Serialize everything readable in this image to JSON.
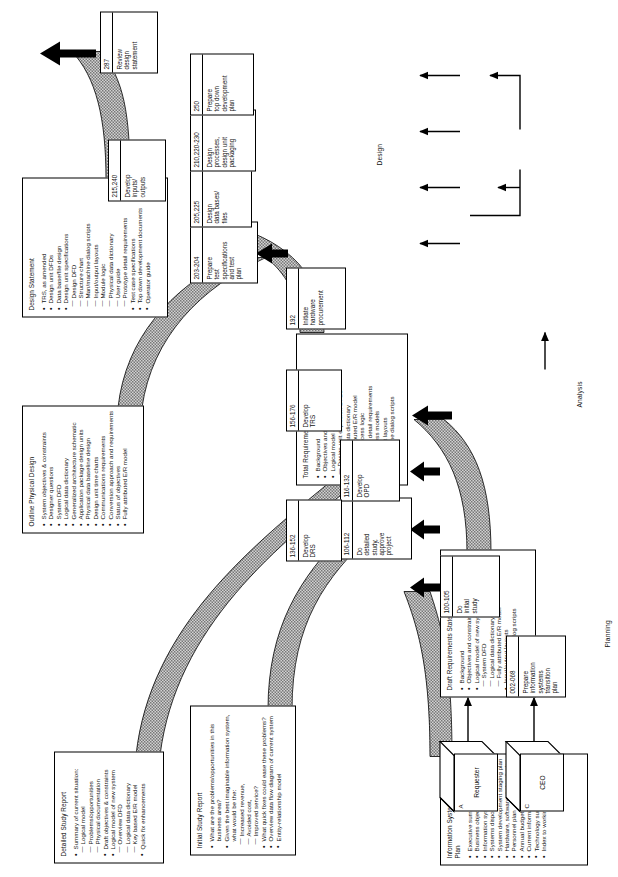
{
  "diagram": {
    "phases": [
      {
        "id": "planning",
        "label": "Planning"
      },
      {
        "id": "analysis",
        "label": "Analysis"
      },
      {
        "id": "design",
        "label": "Design"
      }
    ],
    "external_entities": [
      {
        "tag": "C",
        "label": "CEO"
      },
      {
        "tag": "A",
        "label": "Requester"
      }
    ],
    "processes": [
      {
        "id": "002-068",
        "label": "Prepare\ninformation\nsystems\ntransition\nplan"
      },
      {
        "id": "100-105",
        "label": "Do\ninitial\nstudy"
      },
      {
        "id": "106-112",
        "label": "Do\ndetailed\nstudy,\napprove\nproject"
      },
      {
        "id": "116-132",
        "label": "Develop\nOPD"
      },
      {
        "id": "136-152",
        "label": "Develop\nDRS"
      },
      {
        "id": "156-176",
        "label": "Develop\nTRS"
      },
      {
        "id": "192",
        "label": "Initiate\nhardware\nprocurement"
      },
      {
        "id": "203-204",
        "label": "Prepare\ntest\nspecifications\nand test\nplan"
      },
      {
        "id": "205,225",
        "label": "Design\ndata bases/\nfiles"
      },
      {
        "id": "210,220-230",
        "label": "Design\nprocesses,\ndesign unit\npackaging"
      },
      {
        "id": "215,240",
        "label": "Develop\ninputs/\noutputs"
      },
      {
        "id": "250",
        "label": "Prepare\ntop down\ndevelopment\nplan"
      },
      {
        "id": "287",
        "label": "Review\ndesign\nstatement"
      }
    ],
    "documents": [
      {
        "id": "transition-plan",
        "title": "Information Systems Transition Plan",
        "items": [
          {
            "type": "bullet",
            "text": "Executive summary"
          },
          {
            "type": "bullet",
            "text": "Business objectives and constraints"
          },
          {
            "type": "bullet",
            "text": "Information systems model"
          },
          {
            "type": "bullet",
            "text": "Systems disposition lists summary"
          },
          {
            "type": "bullet",
            "text": "System development staging plan"
          },
          {
            "type": "bullet",
            "text": "Hardware, software, network plan"
          },
          {
            "type": "bullet",
            "text": "Personnel plan"
          },
          {
            "type": "bullet",
            "text": "Annual budgets"
          },
          {
            "type": "bullet",
            "text": "Current information systems evaluation"
          },
          {
            "type": "bullet",
            "text": "Technology summary"
          },
          {
            "type": "bullet",
            "text": "Index to working papers"
          }
        ]
      },
      {
        "id": "initial-study-report",
        "title": "Initial Study Report",
        "items": [
          {
            "type": "bullet",
            "text": "What are the problems/opportunities in this"
          },
          {
            "type": "cont",
            "text": "business area?"
          },
          {
            "type": "bullet",
            "text": "Given the best imaginable information system,"
          },
          {
            "type": "cont",
            "text": "what would be the:"
          },
          {
            "type": "dash",
            "text": "Increased revenue,"
          },
          {
            "type": "dash",
            "text": "Avoided cost,"
          },
          {
            "type": "dash",
            "text": "Improved service?"
          },
          {
            "type": "bullet",
            "text": "What quick fixes could ease these problems?"
          },
          {
            "type": "bullet",
            "text": "Overview data flow diagram of current system"
          },
          {
            "type": "bullet",
            "text": "Entity-relationship model"
          }
        ]
      },
      {
        "id": "detailed-study-report",
        "title": "Detailed Study Report",
        "items": [
          {
            "type": "bullet",
            "text": "Summary of current situation:"
          },
          {
            "type": "dash",
            "text": "Logical model"
          },
          {
            "type": "dash",
            "text": "Problems/opportunities"
          },
          {
            "type": "dash",
            "text": "Physical documentation"
          },
          {
            "type": "bullet",
            "text": "Draft objectives & constraints"
          },
          {
            "type": "bullet",
            "text": "Logical model of new system"
          },
          {
            "type": "dash",
            "text": "Overview DFD"
          },
          {
            "type": "dash",
            "text": "Logical data dictionary"
          },
          {
            "type": "dash",
            "text": "Key based E/R model"
          },
          {
            "type": "bullet",
            "text": "Quick fix enhancements"
          }
        ]
      },
      {
        "id": "draft-requirements-statement",
        "title": "Draft Requirements Statement",
        "items": [
          {
            "type": "bullet",
            "text": "Background"
          },
          {
            "type": "bullet",
            "text": "Objectives and constraints"
          },
          {
            "type": "bullet",
            "text": "Logical model of new system"
          },
          {
            "type": "dash",
            "text": "System DFD"
          },
          {
            "type": "dash",
            "text": "Logical data dictionary"
          },
          {
            "type": "dash",
            "text": "Fully attributed E/R model"
          },
          {
            "type": "bullet",
            "text": "Input/output layouts"
          },
          {
            "type": "bullet",
            "text": "Man/machine dialog scripts"
          }
        ]
      },
      {
        "id": "total-requirement-statement",
        "title": "Total Requirement Statement",
        "items": [
          {
            "type": "bullet",
            "text": "Background"
          },
          {
            "type": "bullet",
            "text": "Objectives and constraints"
          },
          {
            "type": "bullet",
            "text": "Logical model of new system"
          },
          {
            "type": "dash",
            "text": "Design unit explosion DFDs"
          },
          {
            "type": "dash",
            "text": "Logical data dictionary"
          },
          {
            "type": "dash",
            "text": "Fully attributed E/R model"
          },
          {
            "type": "dash",
            "text": "Detail process logic"
          },
          {
            "type": "dash",
            "text": "Prototype detail requirements"
          },
          {
            "type": "dash",
            "text": "Data access models"
          },
          {
            "type": "bullet",
            "text": "Input/output layouts"
          },
          {
            "type": "bullet",
            "text": "Man/machine dialog scripts"
          }
        ]
      },
      {
        "id": "outline-physical-design",
        "title": "Outline Physical Design",
        "items": [
          {
            "type": "bullet",
            "text": "System objectives & constraints"
          },
          {
            "type": "bullet",
            "text": "Designer questions"
          },
          {
            "type": "bullet",
            "text": "System DFD"
          },
          {
            "type": "bullet",
            "text": "Logical data dictionary"
          },
          {
            "type": "bullet",
            "text": "Generalized architecture schematic"
          },
          {
            "type": "bullet",
            "text": "Application package design units"
          },
          {
            "type": "bullet",
            "text": "Physical data baseline design"
          },
          {
            "type": "bullet",
            "text": "Design unit time charts"
          },
          {
            "type": "bullet",
            "text": "Communications requirements"
          },
          {
            "type": "bullet",
            "text": "Conversion approach and requirements"
          },
          {
            "type": "bullet",
            "text": "Status of objectives"
          },
          {
            "type": "bullet",
            "text": "Fully attributed E/R model"
          }
        ]
      },
      {
        "id": "design-statement",
        "title": "Design Statement",
        "items": [
          {
            "type": "bullet",
            "text": "TRS, as amended"
          },
          {
            "type": "bullet",
            "text": "Design unit DFDs"
          },
          {
            "type": "bullet",
            "text": "Data base/file design"
          },
          {
            "type": "bullet",
            "text": "Design unit specifications"
          },
          {
            "type": "dash",
            "text": "Design DFD"
          },
          {
            "type": "dash",
            "text": "Structure chart"
          },
          {
            "type": "dash",
            "text": "Man/machine dialog scripts"
          },
          {
            "type": "dash",
            "text": "Input/output layouts"
          },
          {
            "type": "dash",
            "text": "Module logic"
          },
          {
            "type": "dash",
            "text": "Physical data dictionary"
          },
          {
            "type": "dash",
            "text": "User guide"
          },
          {
            "type": "dash",
            "text": "Prototype detail requirements"
          },
          {
            "type": "bullet",
            "text": "Test case specifications"
          },
          {
            "type": "bullet",
            "text": "Top down development documents"
          },
          {
            "type": "bullet",
            "text": "Operator guide"
          }
        ]
      }
    ],
    "colors": {
      "line": "#000000",
      "fill": "#ffffff",
      "hatch": "#4a4a4a"
    }
  }
}
